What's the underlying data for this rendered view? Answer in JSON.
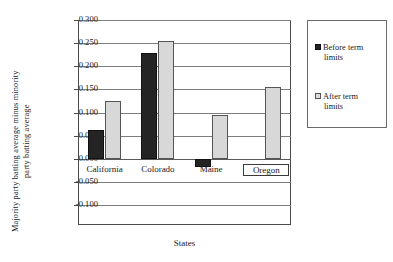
{
  "chart_data": {
    "type": "bar",
    "title": "",
    "xlabel": "States",
    "ylabel": "Majority party batting average minus minority party batting average",
    "ylabel_lines": [
      "Majority party batting average minus minority",
      "party batting average"
    ],
    "categories": [
      "California",
      "Colorado",
      "Maine",
      "Oregon"
    ],
    "series": [
      {
        "name": "Before term limits",
        "color": "#242424",
        "values": [
          0.063,
          0.228,
          -0.018,
          0.0
        ]
      },
      {
        "name": "After term limits",
        "color": "#d8d8d8",
        "values": [
          0.124,
          0.254,
          0.095,
          0.155
        ]
      }
    ],
    "ylim": [
      -0.1,
      0.3
    ],
    "ytick_labels": [
      "0.300",
      "0.250",
      "0.200",
      "0.150",
      "0.100",
      "0.050",
      "0.000",
      "-0.050",
      "-0.100"
    ],
    "ytick_values": [
      0.3,
      0.25,
      0.2,
      0.15,
      0.1,
      0.05,
      0.0,
      -0.05,
      -0.1
    ],
    "grid": true,
    "legend_position": "right",
    "legend_entries": [
      {
        "label_line1": "Before term",
        "label_line2": "limits",
        "swatch": "before"
      },
      {
        "label_line1": "After term",
        "label_line2": "limits",
        "swatch": "after"
      }
    ],
    "annotations": [
      {
        "type": "highlight-box",
        "target": "Oregon",
        "note": "rectangle drawn around the Oregon category label"
      }
    ]
  }
}
